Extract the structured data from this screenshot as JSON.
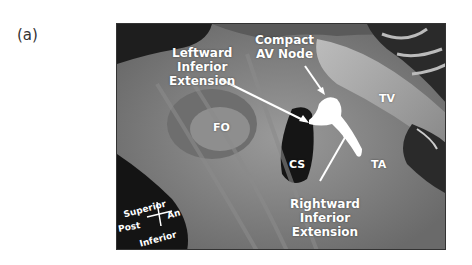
{
  "figure": {
    "panel_label": "(a)",
    "labels": {
      "leftward": [
        "Leftward",
        "Inferior",
        "Extension"
      ],
      "compact": [
        "Compact",
        "AV Node"
      ],
      "rightward": [
        "Rightward",
        "Inferior",
        "Extension"
      ],
      "fo": "FO",
      "cs": "CS",
      "tv": "TV",
      "ta": "TA"
    },
    "orientation": {
      "superior": "Superior",
      "inferior": "Inferior",
      "posterior": "Post",
      "anterior": "An"
    }
  }
}
